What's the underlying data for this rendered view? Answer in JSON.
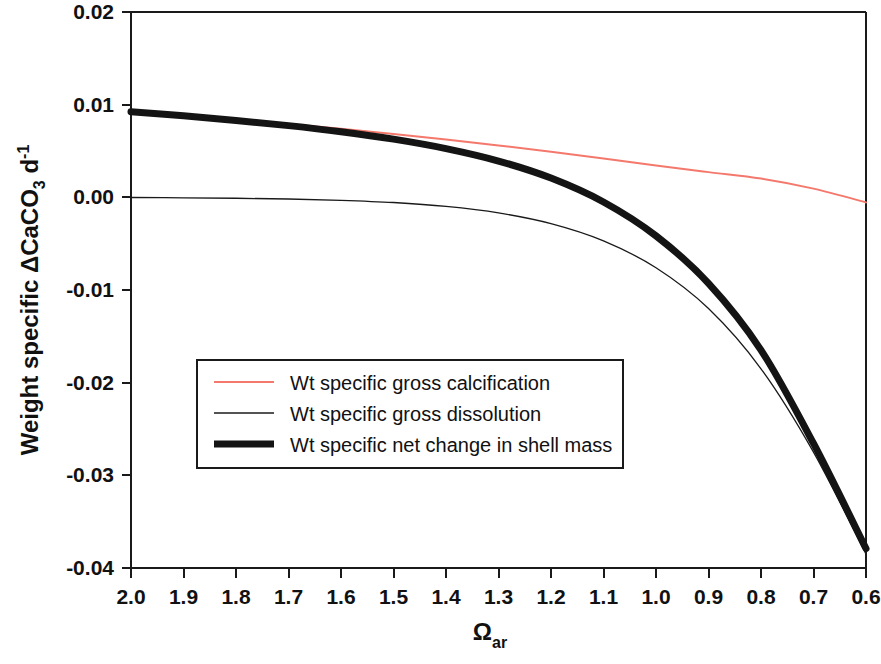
{
  "chart_data": {
    "type": "line",
    "title": "",
    "subtitle": "",
    "xlabel": "Ω",
    "xlabel_sub": "ar",
    "ylabel": "Weight specific ΔCaCO",
    "ylabel_sub": "3",
    "ylabel_tail": " d",
    "ylabel_sup": "-1",
    "ylabel_full": "Weight specific ΔCaCO3 d-1",
    "x_tick_labels": [
      "2.0",
      "1.9",
      "1.8",
      "1.7",
      "1.6",
      "1.5",
      "1.4",
      "1.3",
      "1.2",
      "1.1",
      "1.0",
      "0.9",
      "0.8",
      "0.7",
      "0.6"
    ],
    "x_ticks": [
      2.0,
      1.9,
      1.8,
      1.7,
      1.6,
      1.5,
      1.4,
      1.3,
      1.2,
      1.1,
      1.0,
      0.9,
      0.8,
      0.7,
      0.6
    ],
    "y_tick_labels": [
      "0.02",
      "0.01",
      "0.00",
      "-0.01",
      "-0.02",
      "-0.03",
      "-0.04"
    ],
    "y_ticks": [
      0.02,
      0.01,
      0.0,
      -0.01,
      -0.02,
      -0.03,
      -0.04
    ],
    "xlim": [
      2.0,
      0.6
    ],
    "ylim": [
      -0.04,
      0.02
    ],
    "x_axis_inverted": true,
    "grid": false,
    "legend_position": "center-left-lower",
    "x": [
      2.0,
      1.9,
      1.8,
      1.7,
      1.6,
      1.5,
      1.4,
      1.3,
      1.2,
      1.1,
      1.0,
      0.9,
      0.8,
      0.7,
      0.6
    ],
    "series": [
      {
        "name": "Wt specific gross calcification",
        "color": "#F4786C",
        "width": 2,
        "values": [
          0.00925,
          0.00885,
          0.0084,
          0.00792,
          0.0074,
          0.00684,
          0.00624,
          0.0056,
          0.00492,
          0.0042,
          0.00344,
          0.00272,
          0.00202,
          0.00094,
          -0.00055
        ]
      },
      {
        "name": "Wt specific gross dissolution",
        "color": "#1a1a1a",
        "width": 1.3,
        "values": [
          -2e-05,
          -5e-05,
          -0.0001,
          -0.00018,
          -0.00032,
          -0.00056,
          -0.00098,
          -0.00168,
          -0.00284,
          -0.0047,
          -0.0076,
          -0.012,
          -0.0185,
          -0.0275,
          -0.0385
        ]
      },
      {
        "name": "Wt specific net change in shell mass",
        "color": "#141414",
        "width": 7,
        "values": [
          0.00923,
          0.0088,
          0.0083,
          0.00774,
          0.00708,
          0.00628,
          0.00526,
          0.00392,
          0.00208,
          -0.0005,
          -0.00416,
          -0.00928,
          -0.01648,
          -0.02656,
          -0.0379
        ]
      }
    ]
  },
  "legend": {
    "entries": [
      {
        "label": "Wt specific gross calcification"
      },
      {
        "label": "Wt specific gross dissolution"
      },
      {
        "label": "Wt specific net change in shell mass"
      }
    ]
  },
  "colors": {
    "calcification": "#F4786C",
    "dissolution": "#1a1a1a",
    "net_change": "#141414",
    "axis": "#1a1a1a",
    "background": "#ffffff"
  }
}
